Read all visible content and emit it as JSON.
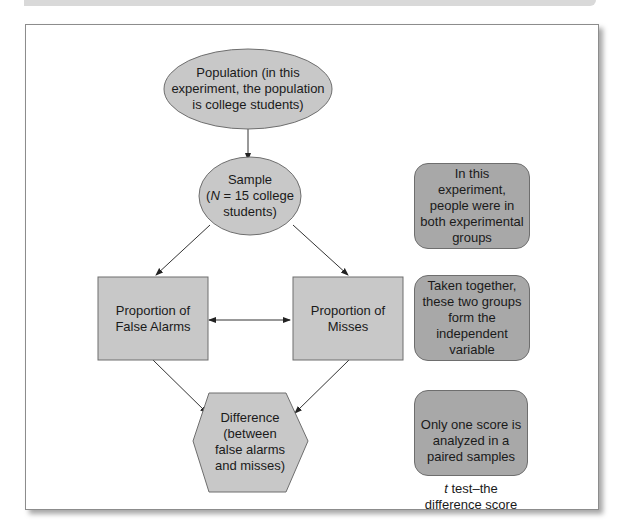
{
  "diagram": {
    "nodes": {
      "population": {
        "shape": "ellipse",
        "text": "Population (in this\nexperiment, the population\nis college students)"
      },
      "sample": {
        "shape": "ellipse",
        "line1": "Sample",
        "line2_italic": "N",
        "line2_rest": " = 15 college",
        "line3": "students)",
        "line2_prefix": "("
      },
      "false_alarms": {
        "shape": "rectangle",
        "text": "Proportion of\nFalse Alarms"
      },
      "misses": {
        "shape": "rectangle",
        "text": "Proportion of\nMisses"
      },
      "difference": {
        "shape": "hexagon",
        "text": "Difference\n(between\nfalse alarms\nand misses)"
      }
    },
    "notes": [
      {
        "text": "In this\nexperiment,\npeople were in\nboth experimental\ngroups"
      },
      {
        "text": "Taken together,\nthese two groups\nform the\nindependent\nvariable"
      },
      {
        "line1": "Only one score is\nanalyzed in a\npaired samples",
        "italic": "t",
        "rest": " test–the\ndifference score"
      }
    ],
    "edges": [
      {
        "from": "population",
        "to": "sample",
        "type": "arrow"
      },
      {
        "from": "sample",
        "to": "false_alarms",
        "type": "arrow"
      },
      {
        "from": "sample",
        "to": "misses",
        "type": "arrow"
      },
      {
        "from": "false_alarms",
        "to": "misses",
        "type": "double-arrow"
      },
      {
        "from": "false_alarms",
        "to": "difference",
        "type": "arrow"
      },
      {
        "from": "misses",
        "to": "difference",
        "type": "arrow"
      }
    ],
    "colors": {
      "node_fill": "#c8c8c8",
      "note_fill": "#a8a8a8",
      "stroke": "#6e6e6e",
      "edge": "#333333"
    }
  }
}
